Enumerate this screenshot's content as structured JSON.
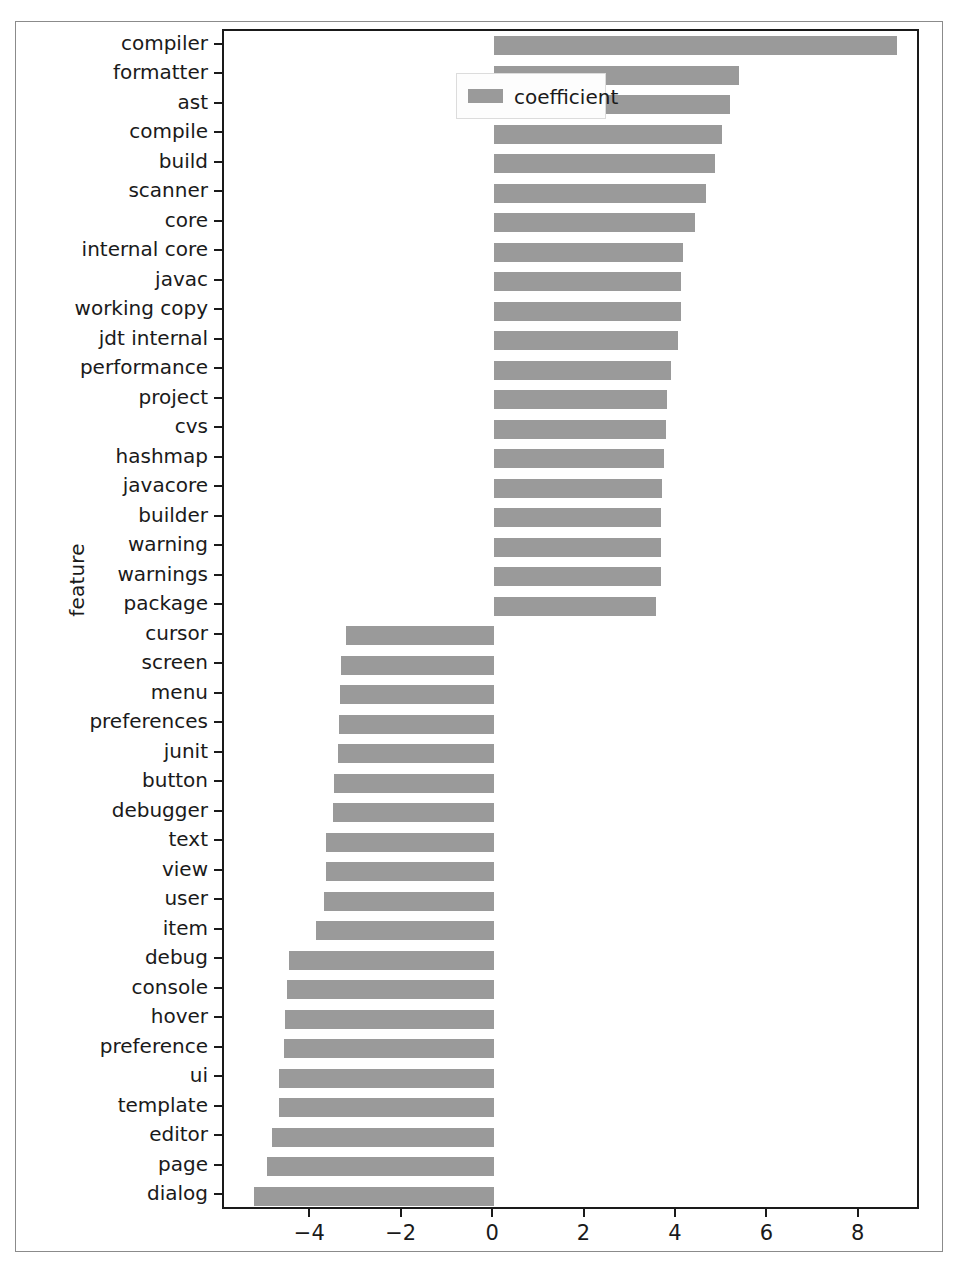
{
  "chart_data": {
    "type": "bar",
    "orientation": "horizontal",
    "title": "",
    "xlabel": "",
    "ylabel": "feature",
    "legend": [
      {
        "name": "coefficient",
        "color": "#9a9a9a"
      }
    ],
    "legend_position": "upper left",
    "grid": false,
    "xlim": [
      -5.91,
      9.34
    ],
    "xticks": [
      -4,
      -2,
      0,
      2,
      4,
      6,
      8
    ],
    "xticklabels": [
      "−4",
      "−2",
      "0",
      "2",
      "4",
      "6",
      "8"
    ],
    "categories": [
      "compiler",
      "formatter",
      "ast",
      "compile",
      "build",
      "scanner",
      "core",
      "internal core",
      "javac",
      "working copy",
      "jdt internal",
      "performance",
      "project",
      "cvs",
      "hashmap",
      "javacore",
      "builder",
      "warning",
      "warnings",
      "package",
      "cursor",
      "screen",
      "menu",
      "preferences",
      "junit",
      "button",
      "debugger",
      "text",
      "view",
      "user",
      "item",
      "debug",
      "console",
      "hover",
      "preference",
      "ui",
      "template",
      "editor",
      "page",
      "dialog"
    ],
    "values": [
      8.82,
      5.36,
      5.17,
      4.99,
      4.83,
      4.64,
      4.4,
      4.14,
      4.1,
      4.08,
      4.03,
      3.86,
      3.79,
      3.77,
      3.72,
      3.68,
      3.66,
      3.66,
      3.65,
      3.54,
      -3.24,
      -3.35,
      -3.37,
      -3.4,
      -3.42,
      -3.51,
      -3.53,
      -3.67,
      -3.68,
      -3.73,
      -3.9,
      -4.49,
      -4.53,
      -4.58,
      -4.6,
      -4.7,
      -4.71,
      -4.87,
      -4.96,
      -5.26
    ]
  },
  "figure": {
    "background": "#ffffff",
    "bar_color": "#9a9a9a",
    "axis_color": "#1a1a1a",
    "frame_color": "#8b8b8b"
  }
}
